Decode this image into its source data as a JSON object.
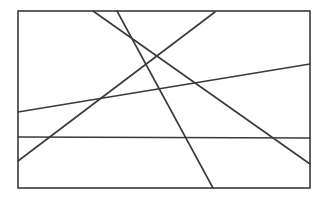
{
  "diagram": {
    "stroke_color": "#3a3a3a",
    "background": "#ffffff",
    "frame": {
      "x": 18,
      "y": 11,
      "width": 292,
      "height": 177
    },
    "lines": [
      {
        "id": "line-1",
        "x1": 93,
        "y1": 11,
        "x2": 310,
        "y2": 164
      },
      {
        "id": "line-2",
        "x1": 117,
        "y1": 11,
        "x2": 213,
        "y2": 188
      },
      {
        "id": "line-3",
        "x1": 215,
        "y1": 12,
        "x2": 18,
        "y2": 161
      },
      {
        "id": "line-4",
        "x1": 18,
        "y1": 112,
        "x2": 310,
        "y2": 64
      },
      {
        "id": "line-5",
        "x1": 18,
        "y1": 137,
        "x2": 310,
        "y2": 138
      }
    ]
  }
}
